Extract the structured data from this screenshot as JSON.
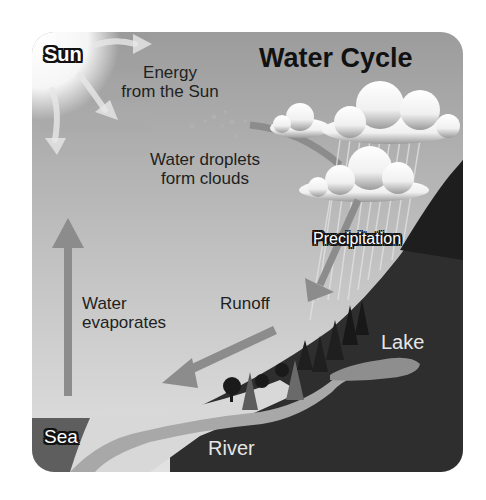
{
  "title": "Water Cycle",
  "labels": {
    "sun": "Sun",
    "energy_line1": "Energy",
    "energy_line2": "from the Sun",
    "droplets_line1": "Water droplets",
    "droplets_line2": "form clouds",
    "precipitation": "Precipitation",
    "evaporates_line1": "Water",
    "evaporates_line2": "evaporates",
    "runoff": "Runoff",
    "lake": "Lake",
    "sea": "Sea",
    "river": "River"
  },
  "colors": {
    "sky_top": "#9a9a9a",
    "sky_bottom": "#dcdcdc",
    "land": "#2e2e2e",
    "water": "#a8a8a8",
    "arrow": "#8c8c8c",
    "cloud": "#f4f4f4",
    "sea": "#5e5e5e"
  }
}
